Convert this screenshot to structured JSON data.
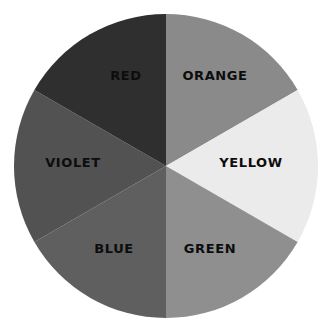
{
  "diagram": {
    "type": "color-wheel",
    "center": {
      "x": 166,
      "y": 166
    },
    "radius": 152,
    "segments": [
      {
        "id": "orange",
        "label": "ORANGE",
        "start_deg": 0,
        "end_deg": 60,
        "fill": "#8a8a8a",
        "label_pos": {
          "x": 215,
          "y": 75
        }
      },
      {
        "id": "yellow",
        "label": "YELLOW",
        "start_deg": 60,
        "end_deg": 120,
        "fill": "#ebebeb",
        "label_pos": {
          "x": 251,
          "y": 162
        }
      },
      {
        "id": "green",
        "label": "GREEN",
        "start_deg": 120,
        "end_deg": 180,
        "fill": "#8f8f8f",
        "label_pos": {
          "x": 210,
          "y": 248
        }
      },
      {
        "id": "blue",
        "label": "BLUE",
        "start_deg": 180,
        "end_deg": 240,
        "fill": "#5f5f5f",
        "label_pos": {
          "x": 114,
          "y": 248
        }
      },
      {
        "id": "violet",
        "label": "VIOLET",
        "start_deg": 240,
        "end_deg": 300,
        "fill": "#525252",
        "label_pos": {
          "x": 73,
          "y": 162
        }
      },
      {
        "id": "red",
        "label": "RED",
        "start_deg": 300,
        "end_deg": 360,
        "fill": "#2f2f2f",
        "label_pos": {
          "x": 126,
          "y": 75
        }
      }
    ]
  }
}
